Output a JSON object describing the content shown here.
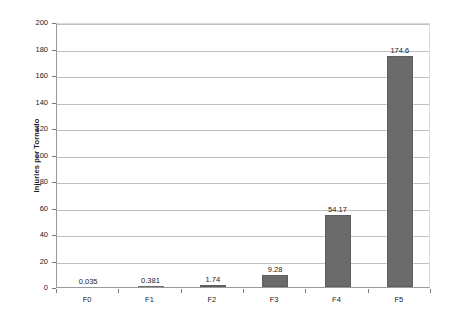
{
  "chart_data": {
    "type": "bar",
    "title": "",
    "subtitle": "",
    "xlabel": "",
    "ylabel": "Injuries per Tornado",
    "categories": [
      "F0",
      "F1",
      "F2",
      "F3",
      "F4",
      "F5"
    ],
    "values": [
      0.035,
      0.381,
      1.74,
      9.28,
      54.17,
      174.6
    ],
    "value_labels": [
      "0.035",
      "0.381",
      "1.74",
      "9.28",
      "54.17",
      "174.6"
    ],
    "series": [
      {
        "name": "Injuries per Tornado",
        "values": [
          0.035,
          0.381,
          1.74,
          9.28,
          54.17,
          174.6
        ]
      }
    ],
    "ylim": [
      0,
      200
    ],
    "y_tick_step": 20,
    "y_ticks": [
      0,
      20,
      40,
      60,
      80,
      100,
      120,
      140,
      160,
      180,
      200
    ],
    "y_tick_labels": [
      "0",
      "20",
      "40",
      "60",
      "80",
      "100",
      "120",
      "140",
      "160",
      "180",
      "200"
    ],
    "grid": {
      "horizontal": true,
      "vertical": false
    },
    "legend": {
      "visible": false,
      "position": "none"
    },
    "colors": {
      "bar_fill": "#6b6b6b",
      "bar_border": "#5e5e5e",
      "gridline": "#bfbfbf",
      "axis": "#9a9a9a",
      "plot_background": "#ffffff",
      "figure_background": "#ffffff",
      "text": "#1a1a1a"
    }
  }
}
